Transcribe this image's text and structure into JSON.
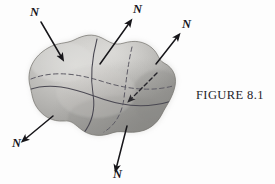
{
  "figure": {
    "caption": "FIGURE 8.1",
    "background_color": "#fdfdfd",
    "surface": {
      "name": "closed-surface-blob",
      "fill_color": "#ababab",
      "highlight_color": "#d6d6d4",
      "shadow_color": "#8a8a8a",
      "outline_color": "#7b7b7b",
      "curve_color": "#4a4852",
      "dashed_curve_color": "#5c5a64"
    },
    "vector_labels": [
      {
        "id": "n-top-left",
        "text": "N",
        "x": 30,
        "y": 16
      },
      {
        "id": "n-top-center",
        "text": "N",
        "x": 133,
        "y": 13
      },
      {
        "id": "n-top-right",
        "text": "N",
        "x": 182,
        "y": 28
      },
      {
        "id": "n-bottom-left",
        "text": "N",
        "x": 12,
        "y": 147
      },
      {
        "id": "n-bottom-center",
        "text": "N",
        "x": 113,
        "y": 178
      },
      {
        "id": "n-interior",
        "text": "",
        "x": 0,
        "y": 0
      }
    ],
    "arrows": [
      {
        "id": "arrow-top-left",
        "style": "solid",
        "from_x": 41,
        "from_y": 22,
        "to_x": 62,
        "to_y": 58
      },
      {
        "id": "arrow-top-center",
        "style": "solid",
        "from_x": 130,
        "from_y": 22,
        "to_x": 102,
        "to_y": 63
      },
      {
        "id": "arrow-top-right",
        "style": "solid",
        "from_x": 178,
        "from_y": 36,
        "to_x": 156,
        "to_y": 63
      },
      {
        "id": "arrow-bottom-left",
        "style": "solid",
        "from_x": 23,
        "from_y": 141,
        "to_x": 53,
        "to_y": 116
      },
      {
        "id": "arrow-bottom-center",
        "style": "solid",
        "from_x": 116,
        "from_y": 170,
        "to_x": 127,
        "to_y": 126
      },
      {
        "id": "arrow-interior",
        "style": "dashed",
        "from_x": 156,
        "from_y": 74,
        "to_x": 130,
        "to_y": 100
      }
    ],
    "curves": [
      {
        "id": "curve-vertical-front",
        "style": "solid"
      },
      {
        "id": "curve-horizontal-front",
        "style": "solid"
      },
      {
        "id": "curve-vertical-back",
        "style": "dashed"
      },
      {
        "id": "curve-horizontal-back",
        "style": "dashed"
      }
    ]
  }
}
